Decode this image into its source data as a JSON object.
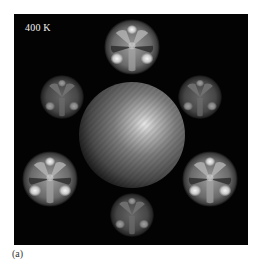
{
  "figure": {
    "panel_label": "(a)",
    "temperature_label": "400 K",
    "background_color": "#030303",
    "central_sphere": {
      "cx": 118,
      "cy": 121,
      "r": 53,
      "highlight": "#e6e6e6",
      "base": "#5a5a5a"
    },
    "blobs": [
      {
        "position": "top",
        "cx": 118,
        "cy": 33,
        "r": 29,
        "brightness": 1.0
      },
      {
        "position": "upper-left",
        "cx": 48,
        "cy": 83,
        "r": 23,
        "brightness": 0.65
      },
      {
        "position": "upper-right",
        "cx": 186,
        "cy": 83,
        "r": 23,
        "brightness": 0.65
      },
      {
        "position": "lower-left",
        "cx": 36,
        "cy": 165,
        "r": 29,
        "brightness": 1.0
      },
      {
        "position": "lower-right",
        "cx": 196,
        "cy": 165,
        "r": 29,
        "brightness": 1.0
      },
      {
        "position": "bottom",
        "cx": 118,
        "cy": 201,
        "r": 23,
        "brightness": 0.65
      }
    ]
  }
}
